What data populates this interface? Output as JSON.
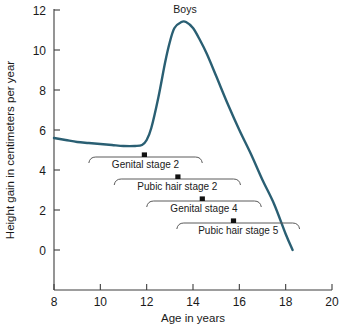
{
  "chart_data": {
    "type": "line",
    "title": "",
    "series_label": "Boys",
    "xlabel": "Age in years",
    "ylabel": "Height gain in centimeters per year",
    "xlim": [
      8,
      20
    ],
    "ylim": [
      0,
      12
    ],
    "xticks": [
      8,
      10,
      12,
      14,
      16,
      18,
      20
    ],
    "xtick_labels": [
      "8",
      "10",
      "12",
      "14",
      "16",
      "18",
      "20"
    ],
    "yticks": [
      0,
      2,
      4,
      6,
      8,
      10,
      12
    ],
    "ytick_labels": [
      "0",
      "2",
      "4",
      "6",
      "8",
      "10",
      "12"
    ],
    "grid": false,
    "legend_position": "none",
    "line_color": "#2a5f73",
    "series": [
      {
        "name": "Boys",
        "x": [
          8.0,
          8.5,
          9.0,
          9.5,
          10.0,
          10.5,
          11.0,
          11.5,
          11.8,
          12.0,
          12.2,
          12.5,
          12.8,
          13.0,
          13.2,
          13.5,
          13.7,
          14.0,
          14.3,
          14.6,
          15.0,
          15.5,
          16.0,
          16.5,
          17.0,
          17.5,
          18.0,
          18.3
        ],
        "y": [
          5.6,
          5.5,
          5.4,
          5.35,
          5.3,
          5.25,
          5.2,
          5.2,
          5.25,
          5.5,
          6.1,
          7.6,
          9.4,
          10.4,
          11.1,
          11.4,
          11.4,
          11.1,
          10.5,
          9.8,
          8.7,
          7.3,
          6.0,
          4.8,
          3.5,
          2.3,
          0.8,
          0.0
        ]
      }
    ],
    "annotations": [
      {
        "label": "Genital stage 2",
        "start_age": 9.5,
        "end_age": 14.4,
        "marker_age": 11.9,
        "row": 0
      },
      {
        "label": "Pubic hair stage 2",
        "start_age": 10.6,
        "end_age": 16.05,
        "marker_age": 13.35,
        "row": 1
      },
      {
        "label": "Genital stage 4",
        "start_age": 12.0,
        "end_age": 16.95,
        "marker_age": 14.4,
        "row": 2
      },
      {
        "label": "Pubic hair stage 5",
        "start_age": 13.3,
        "end_age": 18.6,
        "marker_age": 15.75,
        "row": 3
      }
    ]
  }
}
